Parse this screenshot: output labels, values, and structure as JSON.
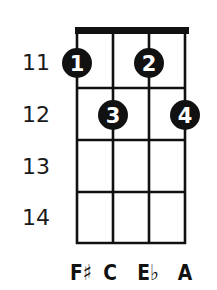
{
  "chord": {
    "type": "ukulele-chord-diagram",
    "strings": 4,
    "start_fret": 11,
    "fret_numbers": [
      "11",
      "12",
      "13",
      "14"
    ],
    "notes": [
      "F♯",
      "C",
      "E♭",
      "A"
    ],
    "fingers": [
      {
        "label": "1",
        "string": 1,
        "fret": 11
      },
      {
        "label": "2",
        "string": 3,
        "fret": 11
      },
      {
        "label": "3",
        "string": 2,
        "fret": 12
      },
      {
        "label": "4",
        "string": 4,
        "fret": 12
      }
    ],
    "colors": {
      "line": "#111111",
      "dot": "#111111",
      "dot_text": "#ffffff",
      "background": "#ffffff"
    }
  }
}
